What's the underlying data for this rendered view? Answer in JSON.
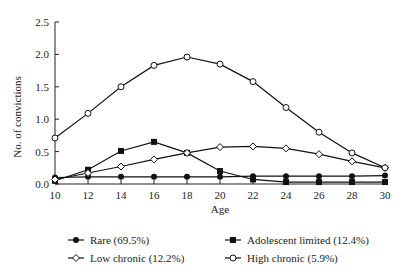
{
  "chart_data": {
    "type": "line",
    "title": "",
    "xlabel": "Age",
    "ylabel": "No. of convictions",
    "x": [
      10,
      12,
      14,
      16,
      18,
      20,
      22,
      24,
      26,
      28,
      30
    ],
    "xlim": [
      10,
      30
    ],
    "ylim": [
      0,
      2.5
    ],
    "yticks": [
      "0.0",
      "0.5",
      "1.0",
      "1.5",
      "2.0",
      "2.5"
    ],
    "xticks": [
      "10",
      "12",
      "14",
      "16",
      "18",
      "20",
      "22",
      "24",
      "26",
      "28",
      "30"
    ],
    "grid": false,
    "legend_position": "bottom",
    "series": [
      {
        "name": "Rare (69.5%)",
        "marker": "filled-circle",
        "values": [
          0.1,
          0.11,
          0.11,
          0.11,
          0.11,
          0.11,
          0.12,
          0.12,
          0.12,
          0.12,
          0.13
        ]
      },
      {
        "name": "Adolescent limited (12.4%)",
        "marker": "filled-square",
        "values": [
          0.05,
          0.22,
          0.51,
          0.65,
          0.48,
          0.2,
          0.07,
          0.03,
          0.03,
          0.03,
          0.03
        ]
      },
      {
        "name": "Low chronic (12.2%)",
        "marker": "open-diamond",
        "values": [
          0.07,
          0.17,
          0.27,
          0.38,
          0.48,
          0.57,
          0.58,
          0.55,
          0.46,
          0.35,
          0.25
        ]
      },
      {
        "name": "High chronic (5.9%)",
        "marker": "open-circle",
        "values": [
          0.71,
          1.09,
          1.5,
          1.83,
          1.96,
          1.85,
          1.58,
          1.18,
          0.8,
          0.48,
          0.25
        ]
      }
    ]
  },
  "legend": {
    "items": [
      {
        "label": "Rare (69.5%)"
      },
      {
        "label": "Adolescent limited (12.4%)"
      },
      {
        "label": "Low chronic (12.2%)"
      },
      {
        "label": "High chronic (5.9%)"
      }
    ]
  }
}
